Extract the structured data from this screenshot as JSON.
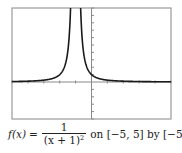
{
  "chart_data": {
    "type": "line",
    "title": "",
    "function": "f(x) = 1/(x+1)^2",
    "xlabel": "",
    "ylabel": "",
    "xlim": [
      -5,
      5
    ],
    "ylim": [
      -5,
      10
    ],
    "x_tick_step": 1,
    "y_tick_step": 1,
    "grid": false,
    "legend": null,
    "vertical_asymptote": -1,
    "series": [
      {
        "name": "f(x) = 1/(x+1)^2",
        "x": [
          -5,
          -4.5,
          -4,
          -3.5,
          -3,
          -2.5,
          -2,
          -1.8,
          -1.6,
          -1.5,
          -1.4,
          -1.35,
          -1.32,
          -0.68,
          -0.65,
          -0.6,
          -0.5,
          -0.4,
          -0.2,
          0,
          0.5,
          1,
          1.5,
          2,
          2.5,
          3,
          3.5,
          4,
          4.5,
          5
        ],
        "y": [
          0.0625,
          0.0816,
          0.1111,
          0.16,
          0.25,
          0.4444,
          1,
          1.5625,
          2.7778,
          4,
          6.25,
          8.16,
          9.77,
          9.77,
          8.16,
          6.25,
          4,
          2.7778,
          1.5625,
          1,
          0.4444,
          0.25,
          0.16,
          0.1111,
          0.0816,
          0.0625,
          0.0494,
          0.04,
          0.0331,
          0.0278
        ]
      }
    ]
  },
  "plot": {
    "frame": {
      "left": 12,
      "top": 8,
      "right": 171,
      "bottom": 119
    },
    "frame_color": "#9a9a9a",
    "axis_color": "#8a8a8a",
    "curve_color": "#1a1a1a"
  },
  "caption": {
    "fx": "f(x)",
    "equals": "=",
    "numerator": "1",
    "denominator_base": "(x + 1)",
    "denominator_exp": "2",
    "rest": "on [−5, 5] by [−5, 10]"
  }
}
